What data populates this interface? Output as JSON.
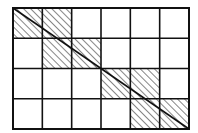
{
  "diagram": {
    "grid": {
      "columns": 6,
      "rows": 4,
      "x0": 13,
      "y0": 8,
      "x1": 189,
      "y1": 129
    },
    "diagonal": {
      "from": "top-left",
      "to": "bottom-right"
    },
    "hatched_cells": [
      {
        "row": 0,
        "col": 0
      },
      {
        "row": 0,
        "col": 1
      },
      {
        "row": 1,
        "col": 1
      },
      {
        "row": 1,
        "col": 2
      },
      {
        "row": 2,
        "col": 3
      },
      {
        "row": 2,
        "col": 4
      },
      {
        "row": 3,
        "col": 4
      },
      {
        "row": 3,
        "col": 5
      }
    ],
    "colors": {
      "line": "#111111",
      "hatch": "#222222",
      "background": "#ffffff"
    }
  }
}
